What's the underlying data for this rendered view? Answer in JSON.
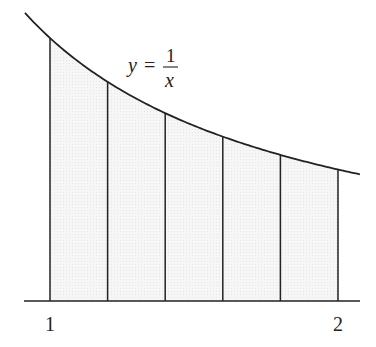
{
  "figure": {
    "curve_label": {
      "lhs": "y",
      "eq": "=",
      "numerator": "1",
      "denominator": "x"
    },
    "axis": {
      "tick_labels": [
        "1",
        "2"
      ]
    },
    "function": "y = 1/x",
    "interval": [
      1,
      2
    ],
    "n_subintervals": 5,
    "partition": [
      1.0,
      1.2,
      1.4,
      1.6,
      1.8,
      2.0
    ],
    "colors": {
      "stroke": "#222222",
      "fill": "#f2f2f2",
      "background": "#ffffff"
    }
  }
}
